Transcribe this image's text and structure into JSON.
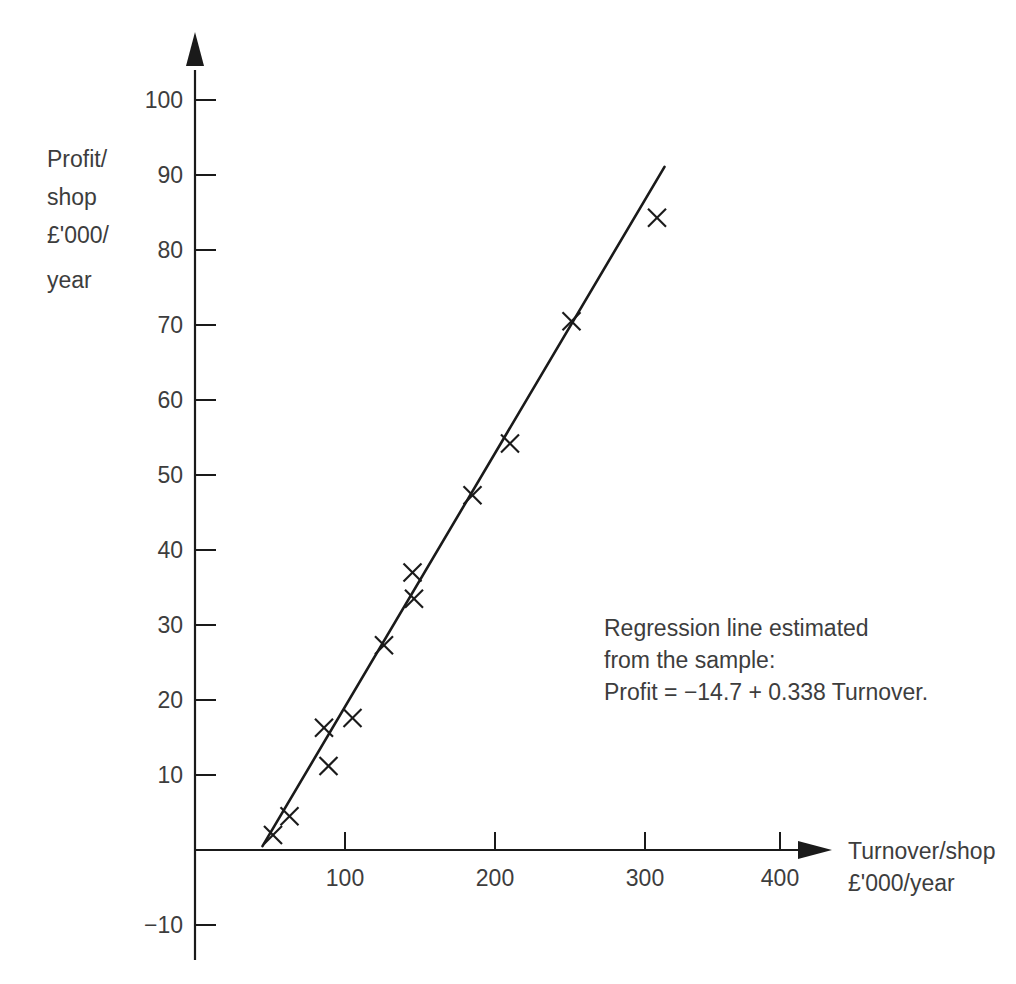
{
  "chart_data": {
    "type": "scatter",
    "title": "",
    "xlabel": "Turnover/shop £'000/year",
    "ylabel": "Profit/shop £'000/year",
    "ylabel_lines": [
      "Profit/",
      "shop",
      "£'000/",
      "year"
    ],
    "xlabel_lines": [
      "Turnover/shop",
      "£'000/year"
    ],
    "xlim": [
      0,
      430
    ],
    "ylim": [
      -14,
      105
    ],
    "xticks": [
      100,
      200,
      300,
      400
    ],
    "xtick_labels": [
      "100",
      "200",
      "300",
      "400"
    ],
    "yticks": [
      -10,
      10,
      20,
      30,
      40,
      50,
      60,
      70,
      80,
      90,
      100
    ],
    "ytick_labels": [
      "−10",
      "10",
      "20",
      "30",
      "40",
      "50",
      "60",
      "70",
      "80",
      "90",
      "100"
    ],
    "grid": false,
    "legend": "none",
    "marker": "x",
    "points": [
      {
        "x": 52,
        "y": 2
      },
      {
        "x": 63,
        "y": 4.5
      },
      {
        "x": 86,
        "y": 16.3
      },
      {
        "x": 89,
        "y": 11.2
      },
      {
        "x": 105,
        "y": 17.6
      },
      {
        "x": 126,
        "y": 27.3
      },
      {
        "x": 145,
        "y": 37
      },
      {
        "x": 146,
        "y": 33.5
      },
      {
        "x": 185,
        "y": 47.3
      },
      {
        "x": 210,
        "y": 54.2
      },
      {
        "x": 251,
        "y": 70.5
      },
      {
        "x": 308,
        "y": 84.3
      }
    ],
    "fit_line": {
      "label": "Regression line",
      "intercept": -14.7,
      "slope": 0.338,
      "x_start": 45,
      "x_end": 313
    },
    "annotation": {
      "lines": [
        "Regression line estimated",
        "from the sample:",
        "Profit = −14.7 + 0.338 Turnover."
      ],
      "line1": "Regression line estimated",
      "line2": "from the sample:",
      "line3": "Profit = −14.7 + 0.338 Turnover."
    },
    "colors": {
      "ink": "#1a1a1a",
      "text": "#3d3d3d",
      "background": "#ffffff"
    }
  }
}
